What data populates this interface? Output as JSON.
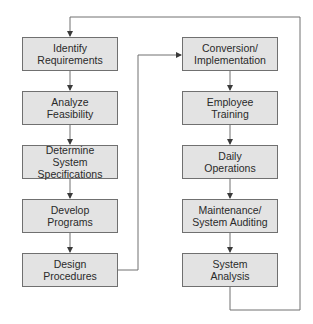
{
  "diagram": {
    "type": "flowchart-cycle",
    "colors": {
      "box_fill": "#e3e3e3",
      "box_border": "#707070",
      "line": "#707070",
      "text": "#2a2a2a"
    },
    "left_column": [
      {
        "id": "identify-requirements",
        "label": "Identify\nRequirements"
      },
      {
        "id": "analyze-feasibility",
        "label": "Analyze\nFeasibility"
      },
      {
        "id": "determine-system-specifications",
        "label": "Determine\nSystem Specifications"
      },
      {
        "id": "develop-programs",
        "label": "Develop\nPrograms"
      },
      {
        "id": "design-procedures",
        "label": "Design\nProcedures"
      }
    ],
    "right_column": [
      {
        "id": "conversion-implementation",
        "label": "Conversion/\nImplementation"
      },
      {
        "id": "employee-training",
        "label": "Employee\nTraining"
      },
      {
        "id": "daily-operations",
        "label": "Daily\nOperations"
      },
      {
        "id": "maintenance-system-auditing",
        "label": "Maintenance/\nSystem Auditing"
      },
      {
        "id": "system-analysis",
        "label": "System\nAnalysis"
      }
    ],
    "edges": [
      [
        "identify-requirements",
        "analyze-feasibility"
      ],
      [
        "analyze-feasibility",
        "determine-system-specifications"
      ],
      [
        "determine-system-specifications",
        "develop-programs"
      ],
      [
        "develop-programs",
        "design-procedures"
      ],
      [
        "design-procedures",
        "conversion-implementation"
      ],
      [
        "conversion-implementation",
        "employee-training"
      ],
      [
        "employee-training",
        "daily-operations"
      ],
      [
        "daily-operations",
        "maintenance-system-auditing"
      ],
      [
        "maintenance-system-auditing",
        "system-analysis"
      ],
      [
        "system-analysis",
        "identify-requirements"
      ]
    ]
  }
}
